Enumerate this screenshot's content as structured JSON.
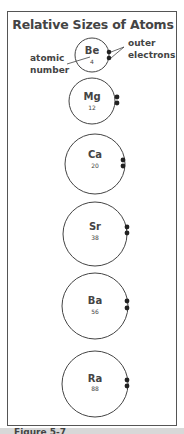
{
  "figure": {
    "title": "Relative Sizes of Atoms",
    "labels": {
      "atomic_number_line1": "atomic",
      "atomic_number_line2": "number",
      "outer_electrons_line1": "outer",
      "outer_electrons_line2": "electrons"
    },
    "caption": "Figure 5-7"
  },
  "atoms": [
    {
      "symbol": "Be",
      "number": "4"
    },
    {
      "symbol": "Mg",
      "number": "12"
    },
    {
      "symbol": "Ca",
      "number": "20"
    },
    {
      "symbol": "Sr",
      "number": "38"
    },
    {
      "symbol": "Ba",
      "number": "56"
    },
    {
      "symbol": "Ra",
      "number": "88"
    }
  ],
  "colors": {
    "outline": "#444444",
    "electron": "#222222",
    "text": "#444444"
  }
}
